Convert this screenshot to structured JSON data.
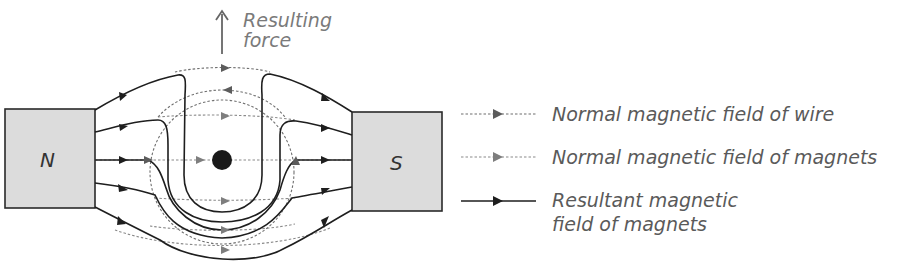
{
  "diagram": {
    "magnets": {
      "north": {
        "label": "N"
      },
      "south": {
        "label": "S"
      }
    },
    "force": {
      "label_line1": "Resulting",
      "label_line2": "force",
      "direction": "up"
    },
    "wire": {
      "description": "wire cross-section (current into/out of page)"
    },
    "colors": {
      "resultant_field": "#1e1e1e",
      "wire_field": "#6f6f6f",
      "magnet_field": "#8a8a8a",
      "magnet_fill": "#dcdcdc",
      "text": "#5a5a5a",
      "force_text": "#7a7a7a"
    }
  },
  "legend": {
    "items": [
      {
        "style": "dotted-dark",
        "label": "Normal magnetic field of wire"
      },
      {
        "style": "dotted-gray",
        "label": "Normal magnetic field of magnets"
      },
      {
        "style": "solid",
        "label_line1": "Resultant magnetic",
        "label_line2": "field of magnets"
      }
    ]
  }
}
